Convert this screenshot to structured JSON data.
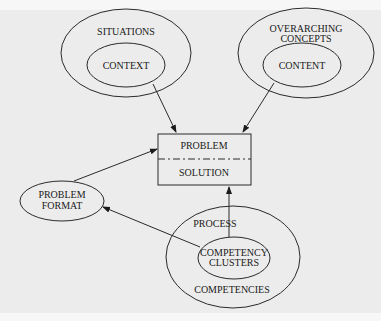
{
  "diagram": {
    "nodes": {
      "situations": {
        "label": "SITUATIONS"
      },
      "context": {
        "label": "CONTEXT"
      },
      "overarching": {
        "line1": "OVERARCHING",
        "line2": "CONCEPTS"
      },
      "content": {
        "label": "CONTENT"
      },
      "problem": {
        "label": "PROBLEM"
      },
      "solution": {
        "label": "SOLUTION"
      },
      "problem_format": {
        "line1": "PROBLEM",
        "line2": "FORMAT"
      },
      "process": {
        "label": "PROCESS"
      },
      "competency_clusters": {
        "line1": "COMPETENCY",
        "line2": "CLUSTERS"
      },
      "competencies": {
        "label": "COMPETENCIES"
      }
    },
    "edges": [
      {
        "from": "CONTEXT",
        "to": "PROBLEM"
      },
      {
        "from": "CONTENT",
        "to": "PROBLEM"
      },
      {
        "from": "PROBLEM FORMAT",
        "to": "PROBLEM"
      },
      {
        "from": "COMPETENCY CLUSTERS",
        "to": "PROBLEM FORMAT"
      },
      {
        "from": "COMPETENCY CLUSTERS",
        "to": "SOLUTION"
      }
    ]
  }
}
